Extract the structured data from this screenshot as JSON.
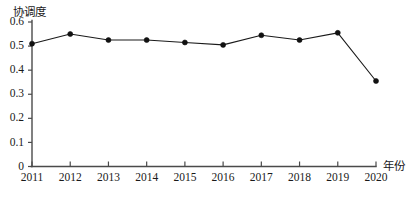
{
  "chart_data": {
    "type": "line",
    "title": "",
    "xlabel": "年份",
    "ylabel": "协调度",
    "categories": [
      "2011",
      "2012",
      "2013",
      "2014",
      "2015",
      "2016",
      "2017",
      "2018",
      "2019",
      "2020"
    ],
    "x": [
      2011,
      2012,
      2013,
      2014,
      2015,
      2016,
      2017,
      2018,
      2019,
      2020
    ],
    "values": [
      0.51,
      0.55,
      0.525,
      0.525,
      0.515,
      0.505,
      0.545,
      0.525,
      0.555,
      0.355
    ],
    "series": [
      {
        "name": "协调度",
        "values": [
          0.51,
          0.55,
          0.525,
          0.525,
          0.515,
          0.505,
          0.545,
          0.525,
          0.555,
          0.355
        ]
      }
    ],
    "ylim": [
      0,
      0.6
    ],
    "xlim": [
      2011,
      2020
    ],
    "ytick_labels": [
      "0",
      "0.1",
      "0.2",
      "0.3",
      "0.4",
      "0.5",
      "0.6"
    ],
    "ytick_values": [
      0,
      0.1,
      0.2,
      0.3,
      0.4,
      0.5,
      0.6
    ],
    "xtick_labels": [
      "2011",
      "2012",
      "2013",
      "2014",
      "2015",
      "2016",
      "2017",
      "2018",
      "2019",
      "2020"
    ],
    "grid": false,
    "legend": "none",
    "marker": "filled-circle",
    "line_color": "#1a1a1a",
    "marker_color": "#111111",
    "axis_color": "#4a4a4a",
    "background": "#ffffff"
  },
  "labels": {
    "y_axis_title": "协调度",
    "x_axis_title": "年份"
  },
  "ticks": {
    "y": [
      "0",
      "0.1",
      "0.2",
      "0.3",
      "0.4",
      "0.5",
      "0.6"
    ],
    "x": [
      "2011",
      "2012",
      "2013",
      "2014",
      "2015",
      "2016",
      "2017",
      "2018",
      "2019",
      "2020"
    ]
  }
}
